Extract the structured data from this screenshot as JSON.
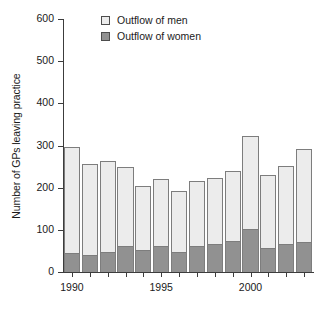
{
  "chart_data": {
    "type": "bar",
    "subtype": "stacked-vertical",
    "title": "",
    "xlabel": "",
    "ylabel": "Number of GPs leaving practice",
    "categories": [
      "1990",
      "1991",
      "1992",
      "1993",
      "1994",
      "1995",
      "1996",
      "1997",
      "1998",
      "1999",
      "2000",
      "2001",
      "2002",
      "2003"
    ],
    "xtick_labels": [
      "1990",
      "1995",
      "2000"
    ],
    "xtick_categories": [
      "1990",
      "1995",
      "2000"
    ],
    "ylim": [
      0,
      600
    ],
    "ytick_labels": [
      "0",
      "100",
      "200",
      "300",
      "400",
      "500",
      "600"
    ],
    "ytick_values": [
      0,
      100,
      200,
      300,
      400,
      500,
      600
    ],
    "grid": false,
    "legend_position": "top-center",
    "series": [
      {
        "name": "Outflow of women",
        "color": "#919191",
        "values": [
          45,
          41,
          47,
          62,
          51,
          62,
          47,
          62,
          67,
          74,
          101,
          58,
          67,
          72
        ]
      },
      {
        "name": "Outflow of men",
        "color": "#ececec",
        "values": [
          252,
          215,
          216,
          186,
          153,
          158,
          145,
          154,
          157,
          166,
          221,
          171,
          184,
          219
        ]
      }
    ],
    "totals": [
      297,
      256,
      263,
      248,
      204,
      220,
      192,
      216,
      224,
      240,
      322,
      229,
      251,
      291
    ]
  },
  "legend": {
    "entries": [
      {
        "label": "Outflow of men",
        "swatch_color": "#ececec"
      },
      {
        "label": "Outflow of women",
        "swatch_color": "#919191"
      }
    ]
  },
  "axes": {
    "y_title": "Number of GPs leaving practice"
  }
}
